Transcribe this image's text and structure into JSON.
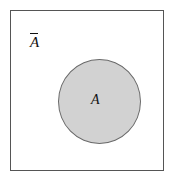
{
  "diagram": {
    "kind": "venn-diagram",
    "universe": {
      "label": "",
      "border_color": "#555555",
      "fill_color": "#ffffff"
    },
    "complement_label": {
      "base": "A",
      "notation": "overbar",
      "text": "A̅"
    },
    "set": {
      "label": "A",
      "fill_color": "#d2d2d2",
      "border_color": "#6a6a6a",
      "shape": "circle"
    }
  }
}
